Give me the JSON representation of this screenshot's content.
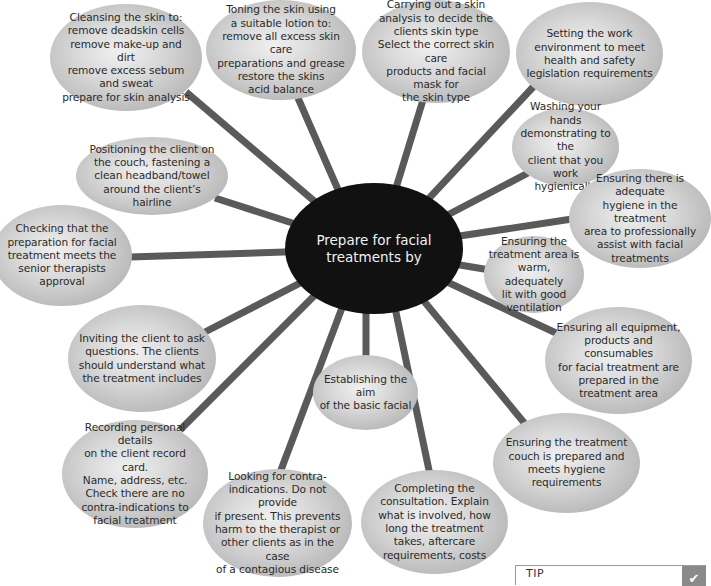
{
  "diagram": {
    "type": "spider-diagram",
    "center": {
      "text": "Prepare for facial\ntreatments by",
      "fill": "#111111",
      "text_color": "#f2f2f2"
    },
    "spoke_color": "#5a5a5a",
    "nodes": [
      {
        "id": "cleansing",
        "text": "Cleansing the skin to:\nremove deadskin cells\nremove make-up and dirt\nremove excess sebum and sweat\nprepare for skin analysis"
      },
      {
        "id": "toning",
        "text": "Toning the skin using\na suitable lotion to:\nremove all excess skin care\npreparations and grease\nrestore the skins\nacid balance"
      },
      {
        "id": "skin-analysis",
        "text": "Carrying out a skin\nanalysis to decide the\nclients skin type\nSelect the correct skin care\nproducts and facial mask for\nthe skin type"
      },
      {
        "id": "work-environment",
        "text": "Setting the work\nenvironment to meet\nhealth and safety\nlegislation requirements"
      },
      {
        "id": "washing-hands",
        "text": "Washing your hands\ndemonstrating to the\nclient that you work\nhygienically"
      },
      {
        "id": "adequate-hygiene",
        "text": "Ensuring there is adequate\nhygiene in the treatment\narea to professionally\nassist with facial\ntreatments"
      },
      {
        "id": "warm-area",
        "text": "Ensuring the\ntreatment area is\nwarm, adequately\nlit with good\nventilation"
      },
      {
        "id": "equipment",
        "text": "Ensuring all equipment,\nproducts and consumables\nfor facial treatment are\nprepared in the\ntreatment area"
      },
      {
        "id": "couch",
        "text": "Ensuring the treatment\ncouch is prepared and\nmeets hygiene\nrequirements"
      },
      {
        "id": "consultation",
        "text": "Completing the\nconsultation. Explain\nwhat is involved, how\nlong the treatment\ntakes, aftercare\nrequirements, costs"
      },
      {
        "id": "contra-indications",
        "text": "Looking for contra-\nindications. Do not provide\nif present. This prevents\nharm to the therapist or\nother clients as in the case\nof a contagious disease"
      },
      {
        "id": "establishing-aim",
        "text": "Establishing the aim\nof the basic facial"
      },
      {
        "id": "recording",
        "text": "Recording personal details\non the client record card.\nName, address, etc.\nCheck there are no\ncontra-indications to\nfacial treatment"
      },
      {
        "id": "inviting-questions",
        "text": "Inviting the client to ask\nquestions. The clients\nshould understand what\nthe treatment includes"
      },
      {
        "id": "checking-approval",
        "text": "Checking that the\npreparation for facial\ntreatment meets the\nsenior therapists approval"
      },
      {
        "id": "positioning",
        "text": "Positioning the client on\nthe couch, fastening a\nclean headband/towel\naround the client’s hairline"
      }
    ]
  },
  "tip": {
    "label": "TIP",
    "icon": "check-icon",
    "icon_glyph": "✔"
  }
}
